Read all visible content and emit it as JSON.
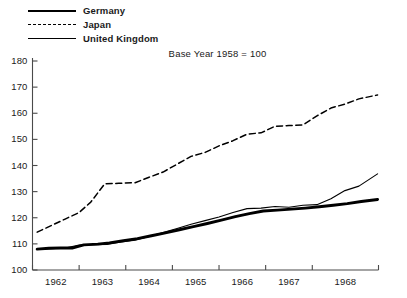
{
  "chart_data": {
    "type": "line",
    "title": "Base Year 1958 = 100",
    "subtitle": "",
    "xlabel": "",
    "ylabel": "",
    "xlim": [
      1961.5,
      1968.92
    ],
    "ylim": [
      100,
      180
    ],
    "grid": false,
    "legend_position": "top-left",
    "y_ticks": [
      100,
      110,
      120,
      130,
      140,
      150,
      160,
      170,
      180
    ],
    "x_ticks": [
      1961.5,
      1962.5,
      1963.5,
      1964.5,
      1965.5,
      1966.5,
      1967.5,
      1968.92
    ],
    "x_tick_labels": [
      "1962",
      "1963",
      "1964",
      "1965",
      "1966",
      "1967",
      "1968"
    ],
    "series": [
      {
        "name": "Germany",
        "style": "solid-thick",
        "color": "#000000",
        "x": [
          1961.6,
          1961.85,
          1962.1,
          1962.35,
          1962.6,
          1962.9,
          1963.15,
          1963.45,
          1963.75,
          1964.05,
          1964.35,
          1964.65,
          1964.95,
          1965.25,
          1965.55,
          1965.85,
          1966.15,
          1966.45,
          1966.75,
          1967.05,
          1967.35,
          1967.65,
          1967.95,
          1968.25,
          1968.55,
          1968.9
        ],
        "y": [
          108.0,
          108.3,
          108.4,
          108.4,
          109.6,
          109.9,
          110.4,
          111.2,
          112.0,
          113.1,
          114.2,
          115.4,
          116.6,
          117.8,
          119.1,
          120.4,
          121.6,
          122.6,
          122.9,
          123.3,
          123.7,
          124.2,
          124.8,
          125.4,
          126.2,
          127.0
        ]
      },
      {
        "name": "Japan",
        "style": "dashed",
        "color": "#000000",
        "x": [
          1961.6,
          1961.9,
          1962.2,
          1962.5,
          1962.75,
          1963.05,
          1963.35,
          1963.7,
          1964.0,
          1964.3,
          1964.6,
          1964.9,
          1965.2,
          1965.5,
          1965.8,
          1966.1,
          1966.4,
          1966.7,
          1967.0,
          1967.3,
          1967.6,
          1967.9,
          1968.2,
          1968.5,
          1968.9
        ],
        "y": [
          114.5,
          117.0,
          119.5,
          122.0,
          126.0,
          133.0,
          133.2,
          133.4,
          135.5,
          137.5,
          140.5,
          143.5,
          145.0,
          147.5,
          149.5,
          152.0,
          152.5,
          155.0,
          155.3,
          155.5,
          159.0,
          162.0,
          163.5,
          165.5,
          167.0
        ]
      },
      {
        "name": "United Kingdom",
        "style": "solid-thin",
        "color": "#000000",
        "x": [
          1961.6,
          1961.9,
          1962.2,
          1962.5,
          1962.8,
          1963.1,
          1963.4,
          1963.7,
          1964.0,
          1964.3,
          1964.6,
          1964.9,
          1965.2,
          1965.5,
          1965.8,
          1966.1,
          1966.4,
          1966.7,
          1967.0,
          1967.3,
          1967.6,
          1967.9,
          1968.2,
          1968.5,
          1968.9
        ],
        "y": [
          107.9,
          108.2,
          108.4,
          109.5,
          109.7,
          109.8,
          110.7,
          111.4,
          112.8,
          114.3,
          115.9,
          117.5,
          118.9,
          120.3,
          122.0,
          123.5,
          123.7,
          124.3,
          124.0,
          124.8,
          125.0,
          127.3,
          130.4,
          132.1,
          136.8
        ]
      }
    ]
  },
  "legend": {
    "items": [
      {
        "label": "Germany",
        "style": "solid-thick"
      },
      {
        "label": "Japan",
        "style": "dashed"
      },
      {
        "label": "United Kingdom",
        "style": "solid-thin"
      }
    ]
  },
  "axes": {
    "y_labels": [
      "180",
      "170",
      "160",
      "150",
      "140",
      "130",
      "120",
      "110",
      "100"
    ],
    "x_labels": [
      "1962",
      "1963",
      "1964",
      "1965",
      "1966",
      "1967",
      "1968"
    ]
  }
}
